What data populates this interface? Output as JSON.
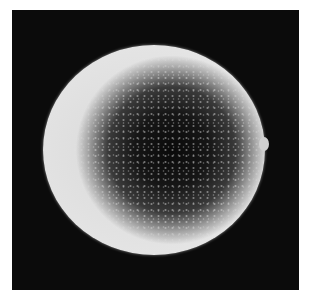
{
  "image": {
    "subject": "sphere-micrograph",
    "description": "Grayscale scanning electron micrograph of a single rough-surfaced spherical particle on a black background",
    "colors": {
      "background": "#0b0b0b",
      "rim": "#e4e4e4",
      "core": "#0a0a0a",
      "page": "#ffffff"
    }
  }
}
